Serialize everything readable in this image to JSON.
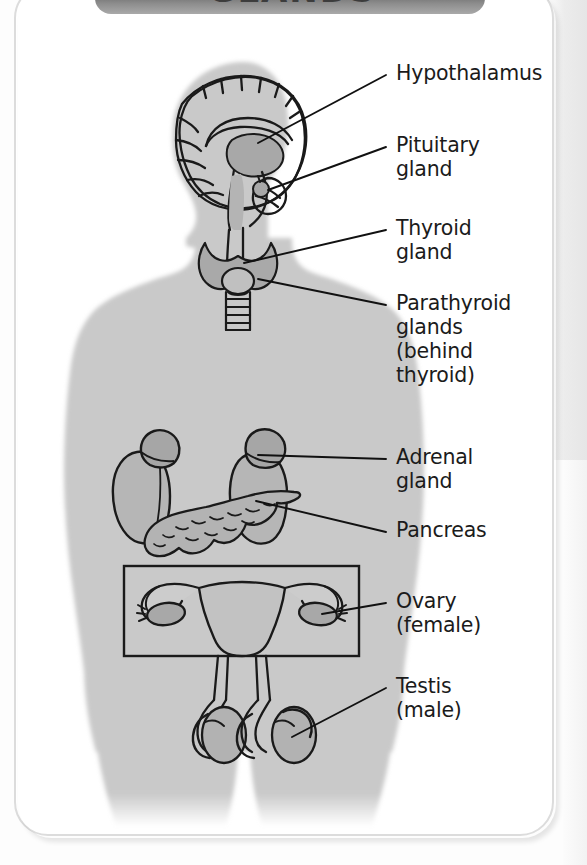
{
  "header": {
    "title": "GLANDS"
  },
  "figure": {
    "body_color": "#c9c9c9",
    "organ_fill": "#b0b0b0",
    "organ_fill_light": "#c4c4c4",
    "outline_color": "#1a1a1a",
    "leader_color": "#111111"
  },
  "labels": [
    {
      "id": "hypothalamus",
      "lines": [
        "Hypothalamus"
      ]
    },
    {
      "id": "pituitary",
      "lines": [
        "Pituitary",
        "gland"
      ]
    },
    {
      "id": "thyroid",
      "lines": [
        "Thyroid",
        "gland"
      ]
    },
    {
      "id": "parathyroid",
      "lines": [
        "Parathyroid",
        "glands",
        "(behind",
        "thyroid)"
      ]
    },
    {
      "id": "adrenal",
      "lines": [
        "Adrenal",
        "gland"
      ]
    },
    {
      "id": "pancreas",
      "lines": [
        "Pancreas"
      ]
    },
    {
      "id": "ovary",
      "lines": [
        "Ovary",
        "(female)"
      ]
    },
    {
      "id": "testis",
      "lines": [
        "Testis",
        "(male)"
      ]
    }
  ],
  "colors": {
    "banner_dark": "#6e6e6e",
    "banner_light": "#a9a9a9",
    "card_border": "#dcdcdc",
    "page_background": "#fdfdfd",
    "text": "#1b1b1b"
  }
}
